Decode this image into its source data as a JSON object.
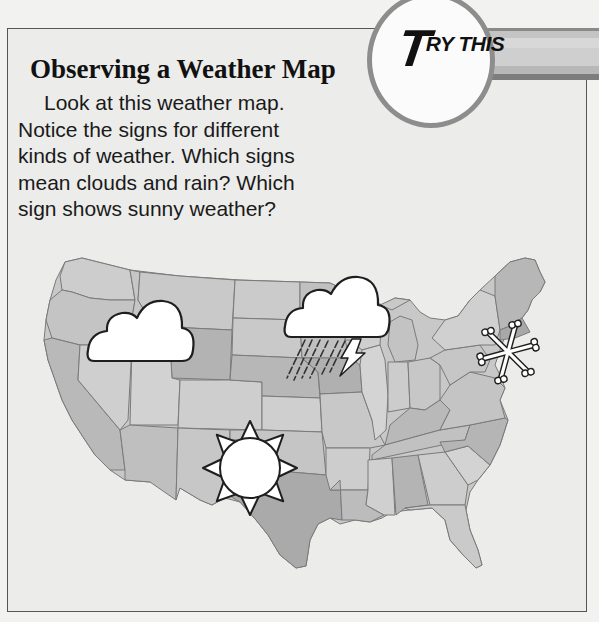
{
  "badge": {
    "initial": "T",
    "rest": "RY THIS",
    "full_label": "TRY THIS"
  },
  "heading": "Observing a Weather Map",
  "body": {
    "lines": [
      "Look at this weather map.",
      "Notice the signs for different",
      "kinds of weather. Which signs",
      "mean clouds and rain? Which",
      "sign shows sunny weather?"
    ]
  },
  "map": {
    "subject": "United States weather map",
    "symbols": [
      {
        "type": "cloud",
        "label": "cloudy",
        "region": "northwest"
      },
      {
        "type": "cloud-rain-lightning",
        "label": "rain and thunderstorms",
        "region": "upper midwest"
      },
      {
        "type": "sun",
        "label": "sunny",
        "region": "southwest / Texas panhandle"
      },
      {
        "type": "snowflake",
        "label": "snow",
        "region": "northeast"
      }
    ]
  },
  "colors": {
    "panel_bg": "#ececea",
    "border": "#555555",
    "badge_ring": "#8d8d8d",
    "state_light": "#cfcfcf",
    "state_mid": "#bdbdbd",
    "state_dark": "#a9a9a9",
    "symbol_fill": "#ffffff",
    "symbol_stroke": "#222222"
  }
}
